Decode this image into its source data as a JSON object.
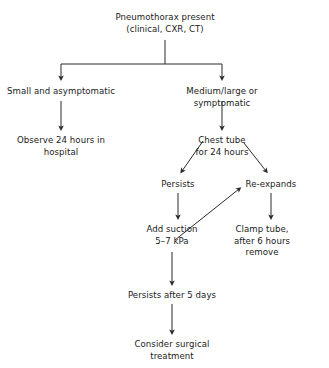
{
  "diagram": {
    "text_color": "#1b1b1b",
    "line_color": "#2a2a2a",
    "background": "#ffffff",
    "nodes": [
      {
        "id": "pneumothorax_present",
        "label": "Pneumothorax present\n(clinical, CXR, CT)",
        "cx": 165,
        "top": 12
      },
      {
        "id": "small_asymptomatic",
        "label": "Small and asymptomatic",
        "cx": 61,
        "top": 86
      },
      {
        "id": "medium_large_symptomatic",
        "label": "Medium/large or symptomatic",
        "cx": 222,
        "top": 86
      },
      {
        "id": "observe_24_hours",
        "label": "Observe 24 hours in\nhospital",
        "cx": 61,
        "top": 135
      },
      {
        "id": "chest_tube",
        "label": "Chest tube\nfor 24 hours",
        "cx": 222,
        "top": 135
      },
      {
        "id": "persists",
        "label": "Persists",
        "cx": 178,
        "top": 179
      },
      {
        "id": "re_expands",
        "label": "Re-expands",
        "cx": 271,
        "top": 179
      },
      {
        "id": "add_suction",
        "label": "Add suction\n5–7 kPa",
        "cx": 172,
        "top": 224
      },
      {
        "id": "clamp_tube",
        "label": "Clamp tube, after 6 hours\nremove",
        "cx": 262,
        "top": 224
      },
      {
        "id": "persists_after_5_days",
        "label": "Persists after 5 days",
        "cx": 172,
        "top": 290
      },
      {
        "id": "consider_surgical",
        "label": "Consider surgical\ntreatment",
        "cx": 172,
        "top": 339
      }
    ],
    "edges": [
      {
        "id": "edge-root-split-stem",
        "from": "pneumothorax_present",
        "to": "split-bar",
        "type": "vertical-plain"
      },
      {
        "id": "edge-split-to-small",
        "from": "split-bar",
        "to": "small_asymptomatic",
        "type": "elbow-arrow"
      },
      {
        "id": "edge-split-to-medium",
        "from": "split-bar",
        "to": "medium_large_symptomatic",
        "type": "elbow-arrow"
      },
      {
        "id": "edge-small-to-observe",
        "from": "small_asymptomatic",
        "to": "observe_24_hours",
        "type": "vertical-arrow"
      },
      {
        "id": "edge-medium-to-chest-tube",
        "from": "medium_large_symptomatic",
        "to": "chest_tube",
        "type": "vertical-arrow"
      },
      {
        "id": "edge-chest-tube-to-persists",
        "from": "chest_tube",
        "to": "persists",
        "type": "diagonal-arrow"
      },
      {
        "id": "edge-chest-tube-to-re-expands",
        "from": "chest_tube",
        "to": "re_expands",
        "type": "diagonal-arrow"
      },
      {
        "id": "edge-persists-to-add-suction",
        "from": "persists",
        "to": "add_suction",
        "type": "vertical-arrow"
      },
      {
        "id": "edge-re-expands-to-clamp-tube",
        "from": "re_expands",
        "to": "clamp_tube",
        "type": "vertical-arrow"
      },
      {
        "id": "edge-add-suction-to-re-expands",
        "from": "add_suction",
        "to": "re_expands",
        "type": "diagonal-arrow"
      },
      {
        "id": "edge-add-suction-to-persists-5-days",
        "from": "add_suction",
        "to": "persists_after_5_days",
        "type": "vertical-arrow"
      },
      {
        "id": "edge-persists-5-days-to-surgical",
        "from": "persists_after_5_days",
        "to": "consider_surgical",
        "type": "vertical-arrow"
      }
    ]
  }
}
